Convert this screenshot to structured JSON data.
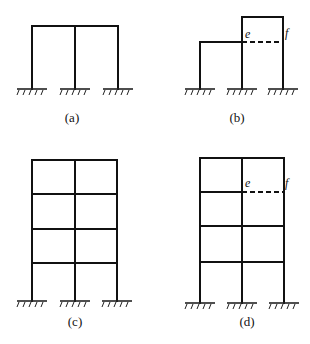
{
  "figures": [
    {
      "id": "a",
      "label": "(a)",
      "description": "single-storey two-bay frame"
    },
    {
      "id": "b",
      "label": "(b)",
      "description": "frame with stepped storey, dashed beam e-f",
      "nodes": [
        "e",
        "f"
      ]
    },
    {
      "id": "c",
      "label": "(c)",
      "description": "four-storey two-bay frame"
    },
    {
      "id": "d",
      "label": "(d)",
      "description": "four-storey two-bay frame, dashed beam e-f on third floor",
      "nodes": [
        "e",
        "f"
      ]
    }
  ],
  "colors": {
    "line": "#111111",
    "background": "#ffffff"
  }
}
